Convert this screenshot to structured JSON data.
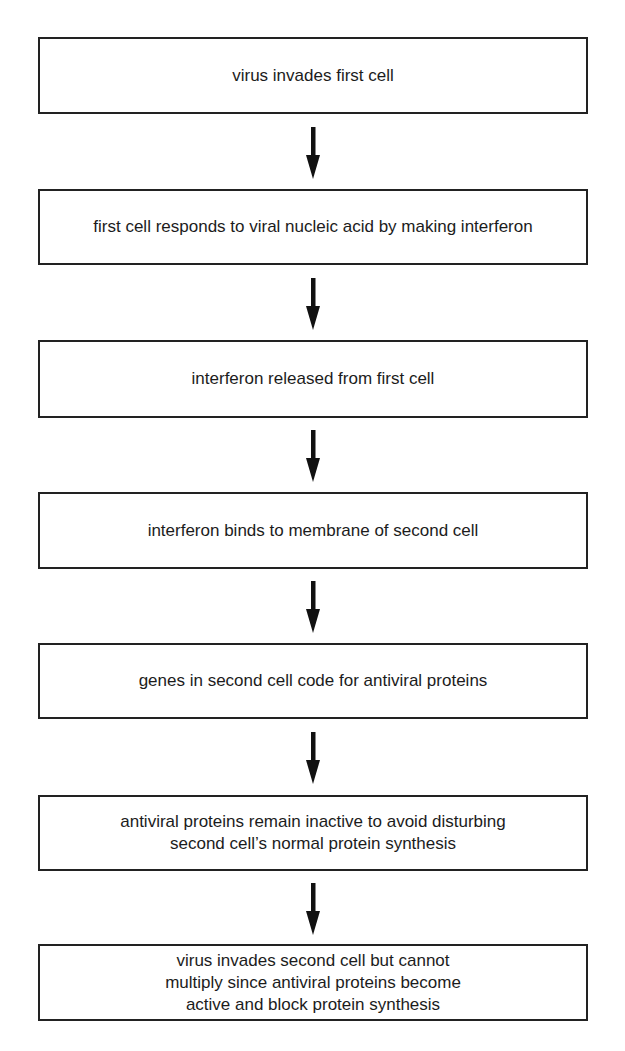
{
  "diagram": {
    "type": "vertical-flowchart",
    "colors": {
      "background": "#ffffff",
      "border": "#222222",
      "text": "#1c1c1c",
      "arrow": "#111111"
    },
    "steps": [
      {
        "label": "virus invades first cell"
      },
      {
        "label": "first cell responds to viral nucleic acid by making interferon"
      },
      {
        "label": "interferon released from first cell"
      },
      {
        "label": "interferon binds to membrane of second cell"
      },
      {
        "label": "genes in second cell code for antiviral proteins"
      },
      {
        "label": "antiviral proteins remain inactive to avoid disturbing\nsecond cell’s normal protein synthesis"
      },
      {
        "label": "virus invades second cell but cannot\nmultiply since antiviral proteins become\nactive and block protein synthesis"
      }
    ],
    "arrows": [
      {
        "from": 0,
        "to": 1,
        "direction": "down"
      },
      {
        "from": 1,
        "to": 2,
        "direction": "down"
      },
      {
        "from": 2,
        "to": 3,
        "direction": "down"
      },
      {
        "from": 3,
        "to": 4,
        "direction": "down"
      },
      {
        "from": 4,
        "to": 5,
        "direction": "down"
      },
      {
        "from": 5,
        "to": 6,
        "direction": "down"
      }
    ]
  }
}
